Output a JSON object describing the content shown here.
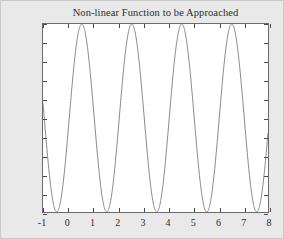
{
  "figure": {
    "background_color": "#e9e9e9",
    "plot_background_color": "#ffffff",
    "axis_color": "#6b6b6b",
    "curve_color": "#7a7a7a"
  },
  "chart_data": {
    "type": "line",
    "title": "Non-linear Function to be Approached",
    "xlabel": "",
    "ylabel": "",
    "xlim": [
      -1,
      8
    ],
    "ylim": [
      0,
      2
    ],
    "grid": false,
    "legend": null,
    "xticks": [
      -1,
      0,
      1,
      2,
      3,
      4,
      5,
      6,
      7,
      8
    ],
    "xticklabels": [
      "-1",
      "0",
      "1",
      "2",
      "3",
      "4",
      "5",
      "6",
      "7",
      "8"
    ],
    "yticks": [
      0,
      0.2,
      0.4,
      0.6,
      0.8,
      1,
      1.2,
      1.4,
      1.6,
      1.8,
      2
    ],
    "yticklabels": [
      "0",
      "0.2",
      "0.4",
      "0.6",
      "0.8",
      "1",
      "1.2",
      "1.4",
      "1.6",
      "1.8",
      "2"
    ],
    "function": "y = 1 + sin(pi * (x - 0.55))",
    "period": 2,
    "amplitude": 1,
    "offset": 1,
    "peaks_x": [
      0.55,
      2.55,
      4.55,
      6.55
    ],
    "peak_value": 2,
    "minima_x": [
      -0.45,
      1.55,
      3.55,
      5.55,
      7.55
    ],
    "minimum_value": 0,
    "series": [
      {
        "name": "non-linear function",
        "x": [
          -1,
          -0.9,
          -0.8,
          -0.7,
          -0.6,
          -0.5,
          -0.4,
          -0.3,
          -0.2,
          -0.1,
          0,
          0.1,
          0.2,
          0.3,
          0.4,
          0.5,
          0.6,
          0.7,
          0.8,
          0.9,
          1,
          1.1,
          1.2,
          1.3,
          1.4,
          1.5,
          1.6,
          1.7,
          1.8,
          1.9,
          2,
          2.1,
          2.2,
          2.3,
          2.4,
          2.5,
          2.6,
          2.7,
          2.8,
          2.9,
          3,
          3.1,
          3.2,
          3.3,
          3.4,
          3.5,
          3.6,
          3.7,
          3.8,
          3.9,
          4,
          4.1,
          4.2,
          4.3,
          4.4,
          4.5,
          4.6,
          4.7,
          4.8,
          4.9,
          5,
          5.1,
          5.2,
          5.3,
          5.4,
          5.5,
          5.6,
          5.7,
          5.8,
          5.9,
          6,
          6.1,
          6.2,
          6.3,
          6.4,
          6.5,
          6.6,
          6.7,
          6.8,
          6.9,
          7,
          7.1,
          7.2,
          7.3,
          7.4,
          7.5,
          7.6,
          7.7,
          7.8,
          7.9,
          8
        ],
        "y": [
          0.88,
          0.69,
          0.5,
          0.33,
          0.19,
          0.09,
          0.02,
          0.0,
          0.02,
          0.09,
          0.19,
          0.33,
          0.5,
          0.69,
          0.88,
          1.06,
          1.24,
          1.41,
          1.56,
          1.69,
          1.8,
          1.89,
          1.95,
          1.99,
          2.0,
          1.98,
          1.93,
          1.85,
          1.75,
          1.62,
          1.48,
          1.32,
          1.16,
          0.99,
          0.81,
          0.64,
          0.48,
          0.33,
          0.2,
          0.11,
          0.04,
          0.0,
          0.0,
          0.03,
          0.1,
          0.2,
          0.33,
          0.48,
          0.64,
          0.81,
          0.99,
          1.16,
          1.32,
          1.48,
          1.62,
          1.75,
          1.85,
          1.93,
          1.98,
          2.0,
          1.99,
          1.95,
          1.89,
          1.8,
          1.69,
          1.56,
          1.41,
          1.24,
          1.06,
          0.88,
          0.69,
          0.5,
          0.33,
          0.19,
          0.09,
          0.02,
          0.0,
          0.02,
          0.09,
          0.19,
          0.33,
          0.5,
          0.69,
          0.88,
          1.06,
          1.24,
          1.41,
          1.56,
          1.69,
          1.8,
          1.89
        ]
      }
    ]
  }
}
